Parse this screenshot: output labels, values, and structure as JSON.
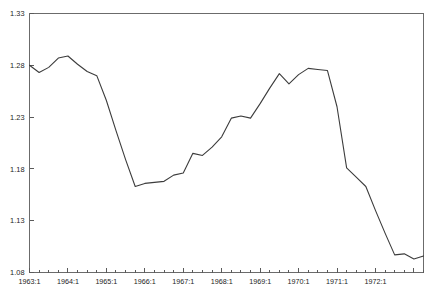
{
  "chart_data": {
    "type": "line",
    "title": "",
    "subtitle": "",
    "xlabel": "",
    "ylabel": "",
    "ylim": [
      1.08,
      1.33
    ],
    "yticks": [
      "1.08",
      "1.13",
      "1.18",
      "1.23",
      "1.28",
      "1.33"
    ],
    "ytick_values": [
      1.08,
      1.13,
      1.18,
      1.23,
      1.28,
      1.33
    ],
    "grid": false,
    "legend": "none",
    "frequency": "quarterly",
    "xtick_labels": [
      "1963:1",
      "1964:1",
      "1965:1",
      "1966:1",
      "1967:1",
      "1968:1",
      "1969:1",
      "1970:1",
      "1971:1",
      "1972:1"
    ],
    "x": [
      "1963:1",
      "1963:2",
      "1963:3",
      "1963:4",
      "1964:1",
      "1964:2",
      "1964:3",
      "1964:4",
      "1965:1",
      "1965:2",
      "1965:3",
      "1965:4",
      "1966:1",
      "1966:2",
      "1966:3",
      "1966:4",
      "1967:1",
      "1967:2",
      "1967:3",
      "1967:4",
      "1968:1",
      "1968:2",
      "1968:3",
      "1968:4",
      "1969:1",
      "1969:2",
      "1969:3",
      "1969:4",
      "1970:1",
      "1970:2",
      "1970:3",
      "1970:4",
      "1971:1",
      "1971:2",
      "1971:3",
      "1971:4",
      "1972:1",
      "1972:2",
      "1972:3",
      "1972:4",
      "1973:1",
      "1973:2"
    ],
    "series": [
      {
        "name": "series1",
        "color": "#3c3c3c",
        "values": [
          1.28,
          1.273,
          1.278,
          1.287,
          1.289,
          1.281,
          1.274,
          1.27,
          1.246,
          1.217,
          1.189,
          1.163,
          1.166,
          1.167,
          1.168,
          1.174,
          1.176,
          1.195,
          1.193,
          1.201,
          1.211,
          1.229,
          1.231,
          1.229,
          1.243,
          1.258,
          1.272,
          1.262,
          1.271,
          1.277,
          1.276,
          1.275,
          1.24,
          1.181,
          1.172,
          1.163,
          1.14,
          1.118,
          1.097,
          1.098,
          1.093,
          1.096
        ]
      }
    ],
    "axis_color": "#5a5a5a",
    "line_color": "#3c3c3c",
    "background": "#ffffff"
  },
  "caption": {
    "text": ""
  }
}
